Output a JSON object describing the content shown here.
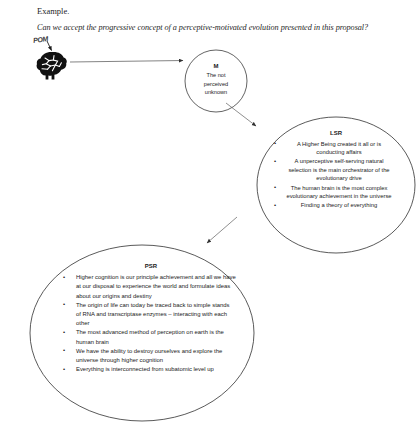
{
  "document": {
    "heading": "Example.",
    "question": "Can we accept the progressive concept of a perceptive-motivated evolution presented in this proposal?"
  },
  "diagram": {
    "type": "flow-diagram",
    "source_icon": {
      "icon": "brain-icon",
      "label": "POM"
    },
    "nodes": [
      {
        "id": "M",
        "shape": "circle",
        "title": "M",
        "body": "The not perceived unknown",
        "lines": [
          "The not",
          "perceived",
          "unknown"
        ]
      },
      {
        "id": "LSR",
        "shape": "ellipse",
        "title": "LSR",
        "bullets": [
          "A Higher Being created it all or is conducting affairs",
          "A unperceptive self-serving natural selection is the main orchestrator of the evolutionary drive",
          "The human brain is the most complex evolutionary achievement in the universe",
          "Finding a theory of everything"
        ]
      },
      {
        "id": "PSR",
        "shape": "ellipse",
        "title": "PSR",
        "bullets": [
          "Higher cognition is our principle achievement and all we have at our disposal to experience the world and formulate ideas about our origins and destiny",
          "The origin of life can today be traced back to simple stands of RNA and transcriptase enzymes – interacting with each other",
          "The most advanced method of perception on earth is the human brain",
          "We have the ability to destroy ourselves and explore the universe through higher cognition",
          "Everything is interconnected from subatomic level up"
        ]
      }
    ],
    "edges": [
      {
        "from": "brain-icon",
        "to": "M",
        "style": "arrow-horizontal"
      },
      {
        "from": "M",
        "to": "LSR",
        "style": "arrow-diagonal-down-right"
      },
      {
        "from": "LSR",
        "to": "PSR",
        "style": "arrow-diagonal-down-left"
      },
      {
        "from": "label",
        "to": "brain-icon",
        "style": "arrow-short-down"
      }
    ],
    "colors": {
      "stroke": "#3c3c3c",
      "text": "#1a1a1a",
      "background": "#ffffff",
      "icon": "#111111"
    }
  }
}
